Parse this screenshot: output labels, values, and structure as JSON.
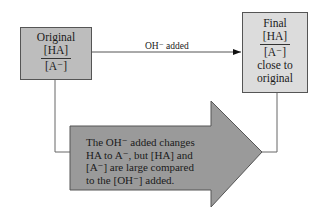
{
  "diagram": {
    "original_box": {
      "title": "Original",
      "numerator": "[HA]",
      "denominator": "[A⁻]",
      "fill": "#bdbdbd"
    },
    "final_box": {
      "title": "Final",
      "numerator": "[HA]",
      "denominator": "[A⁻]",
      "note_line1": "close to",
      "note_line2": "original",
      "fill": "#dcdcdc"
    },
    "connector_label": "OH⁻ added",
    "explanation_arrow": {
      "line1": "The OH⁻ added changes",
      "line2": "HA to A⁻, but [HA] and",
      "line3": "[A⁻] are large compared",
      "line4": "to the [OH⁻] added.",
      "fill": "#9a9a9a"
    }
  }
}
